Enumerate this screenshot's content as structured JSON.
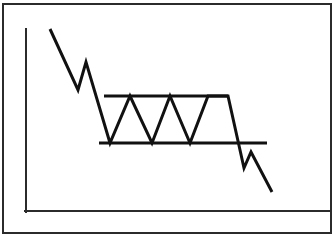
{
  "figure": {
    "kind": "technical-analysis-price-chart-diagram",
    "width": 335,
    "height": 237,
    "background_color": "#ffffff",
    "line_color": "#111111",
    "border_color": "#2b2b2b"
  },
  "frame": {
    "border": {
      "x": 3,
      "y": 4,
      "width": 328,
      "height": 229,
      "stroke_width": 2
    }
  },
  "axes": {
    "y_axis": {
      "x1": 26,
      "y1": 29,
      "x2": 26,
      "y2": 212,
      "stroke_width": 2
    },
    "x_axis": {
      "x1": 25,
      "y1": 211,
      "x2": 330,
      "y2": 211,
      "stroke_width": 2
    },
    "xlabel": "",
    "ylabel": "",
    "grid": "off"
  },
  "chart_data": {
    "type": "line",
    "xlabel": "",
    "ylabel": "",
    "xlim": [
      26,
      331
    ],
    "ylim": [
      211,
      20
    ],
    "grid": false,
    "legend": "none",
    "series": [
      {
        "name": "price",
        "stroke_width": 3,
        "points": [
          [
            50,
            29
          ],
          [
            78,
            90
          ],
          [
            86,
            62
          ],
          [
            110,
            143
          ],
          [
            130,
            96
          ],
          [
            152,
            143
          ],
          [
            170,
            96
          ],
          [
            190,
            143
          ],
          [
            208,
            96
          ],
          [
            228,
            96
          ],
          [
            244,
            168
          ],
          [
            251,
            152
          ],
          [
            272,
            192
          ]
        ]
      }
    ],
    "annotations": [
      {
        "name": "resistance-line",
        "label": "Resistance",
        "type": "horizontal-line",
        "x1": 104,
        "x2": 228,
        "y": 96,
        "stroke_width": 3
      },
      {
        "name": "support-line",
        "label": "Support",
        "type": "horizontal-line",
        "x1": 99,
        "x2": 267,
        "y": 143,
        "stroke_width": 3
      }
    ],
    "pattern_phases": [
      {
        "name": "downtrend",
        "description": "Prior declining trend into the pattern"
      },
      {
        "name": "rectangle-consolidation",
        "description": "Three touches of resistance, three touches of support"
      },
      {
        "name": "breakdown",
        "description": "Break below support, pullback, continued decline"
      }
    ],
    "touch_counts": {
      "resistance": 3,
      "support": 3
    }
  }
}
